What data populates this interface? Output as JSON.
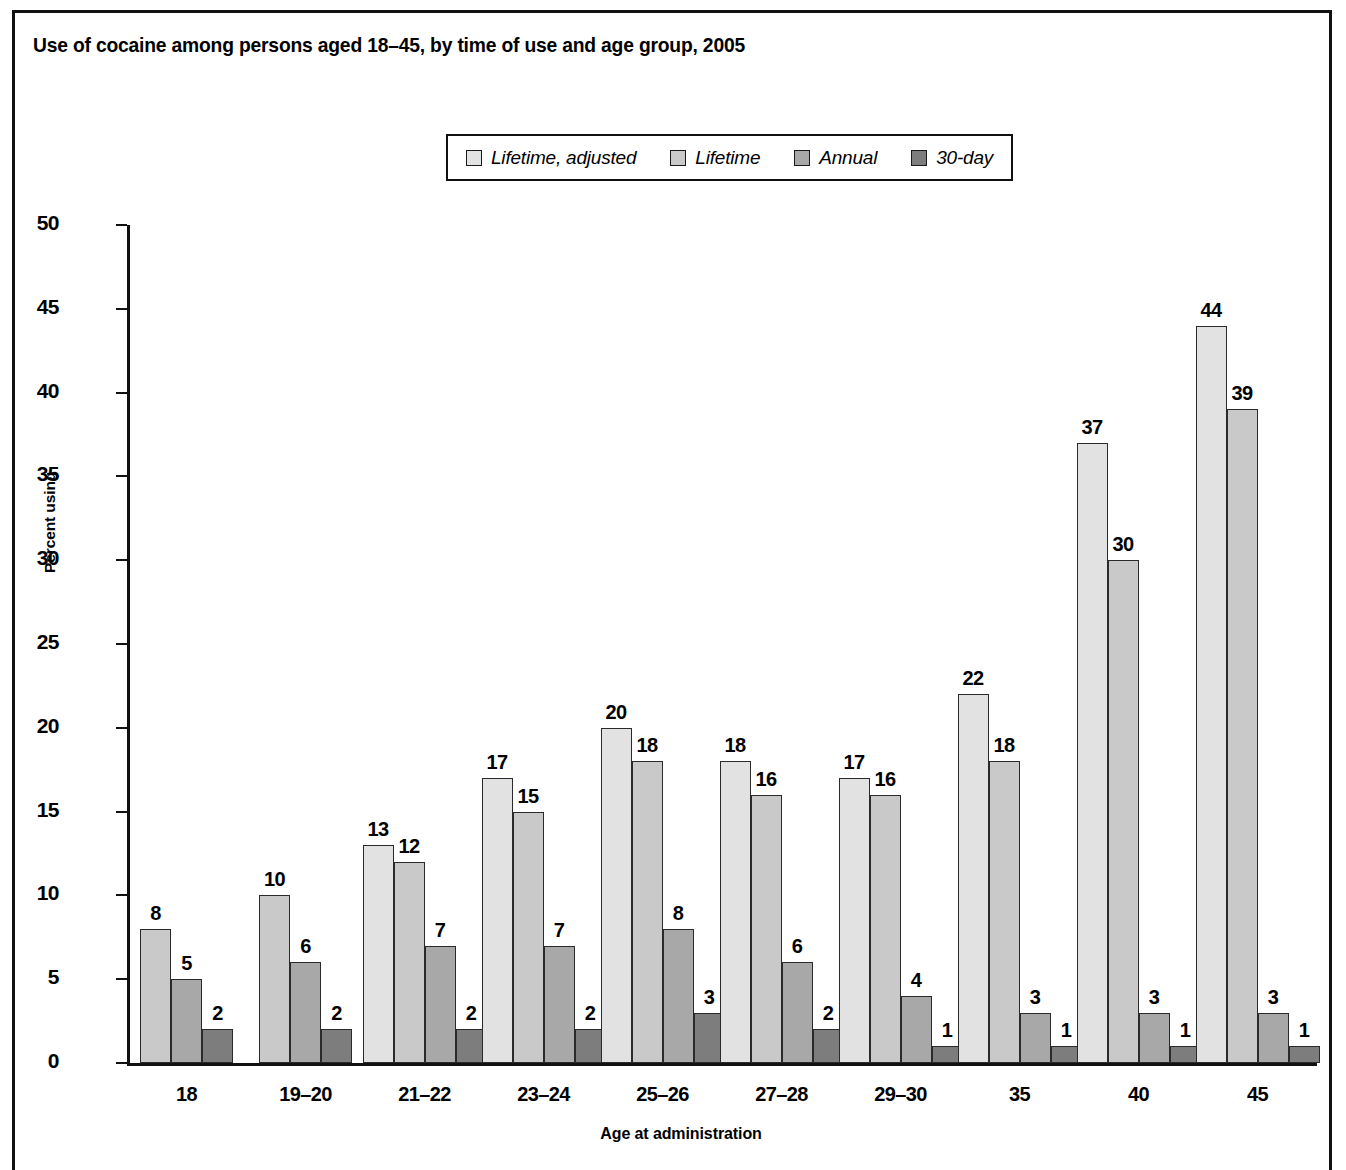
{
  "figure": {
    "title": "Use of cocaine among persons aged 18–45, by time of use and age group, 2005"
  },
  "legend": {
    "position": "top-center",
    "items": [
      {
        "label": "Lifetime, adjusted",
        "color": "#e2e2e2",
        "swatch_name": "legend-swatch-lifetime-adjusted"
      },
      {
        "label": "Lifetime",
        "color": "#c9c9c9",
        "swatch_name": "legend-swatch-lifetime"
      },
      {
        "label": "Annual",
        "color": "#a8a8a8",
        "swatch_name": "legend-swatch-annual"
      },
      {
        "label": "30-day",
        "color": "#7d7d7d",
        "swatch_name": "legend-swatch-30-day"
      }
    ]
  },
  "chart_data": {
    "type": "bar",
    "title": "Use of cocaine among persons aged 18–45, by time of use and age group, 2005",
    "xlabel": "Age at administration",
    "ylabel": "Percent using",
    "ylim": [
      0,
      50
    ],
    "yticks": [
      0,
      5,
      10,
      15,
      20,
      25,
      30,
      35,
      40,
      45,
      50
    ],
    "ytick_labels": [
      "0",
      "5",
      "10",
      "15",
      "20",
      "25",
      "30",
      "35",
      "40",
      "45",
      "50"
    ],
    "grid": false,
    "legend_position": "top-center",
    "categories": [
      "18",
      "19–20",
      "21–22",
      "23–24",
      "25–26",
      "27–28",
      "29–30",
      "35",
      "40",
      "45"
    ],
    "series": [
      {
        "name": "Lifetime, adjusted",
        "color": "#e2e2e2",
        "values": [
          null,
          null,
          13,
          17,
          20,
          18,
          17,
          22,
          37,
          44
        ]
      },
      {
        "name": "Lifetime",
        "color": "#c9c9c9",
        "values": [
          8,
          10,
          12,
          15,
          18,
          16,
          16,
          18,
          30,
          39
        ]
      },
      {
        "name": "Annual",
        "color": "#a8a8a8",
        "values": [
          5,
          6,
          7,
          7,
          8,
          6,
          4,
          3,
          3,
          3
        ]
      },
      {
        "name": "30-day",
        "color": "#7d7d7d",
        "values": [
          2,
          2,
          2,
          2,
          3,
          2,
          1,
          1,
          1,
          1
        ]
      }
    ]
  }
}
